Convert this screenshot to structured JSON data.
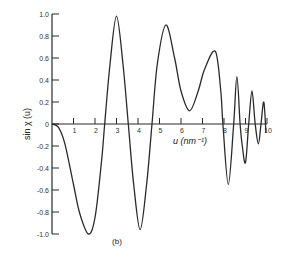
{
  "chart_data": {
    "type": "line",
    "title": "",
    "panel_label": "(b)",
    "xlabel": "u (nm⁻¹)",
    "ylabel": "sin χ (u)",
    "xlim": [
      0,
      10
    ],
    "ylim": [
      -1.0,
      1.0
    ],
    "grid": false,
    "legend": null,
    "x_ticks": [
      1,
      2,
      3,
      4,
      5,
      6,
      7,
      8,
      9,
      10
    ],
    "x_tick_labels": [
      "1",
      "2",
      "3",
      "4",
      "5",
      "6",
      "7",
      "8",
      "9",
      "10"
    ],
    "y_ticks": [
      1.0,
      0.8,
      0.6,
      0.4,
      0.2,
      0,
      -0.2,
      -0.4,
      -0.6,
      -0.8,
      -1.0
    ],
    "y_tick_labels": [
      "1.0",
      "0.8",
      "0.6",
      "0.4",
      "0.2",
      "0",
      "-0.2",
      "-0.4",
      "-0.6",
      "-0.8",
      "-1.0"
    ],
    "series": [
      {
        "name": "sin χ(u)",
        "x": [
          0,
          0.3,
          0.6,
          1.0,
          1.3,
          1.7,
          2.0,
          2.3,
          2.45,
          2.7,
          3.0,
          3.3,
          3.55,
          3.8,
          4.1,
          4.4,
          4.65,
          4.9,
          5.3,
          5.7,
          6.0,
          6.4,
          6.8,
          7.1,
          7.6,
          7.85,
          7.95,
          8.2,
          8.45,
          8.6,
          8.75,
          8.85,
          9.0,
          9.15,
          9.3,
          9.45,
          9.6,
          9.72,
          9.85,
          9.95
        ],
        "y": [
          0,
          -0.03,
          -0.18,
          -0.55,
          -0.82,
          -1.0,
          -0.85,
          -0.35,
          0,
          0.55,
          0.98,
          0.55,
          0,
          -0.55,
          -0.96,
          -0.55,
          0,
          0.55,
          0.9,
          0.6,
          0.3,
          0.12,
          0.3,
          0.5,
          0.66,
          0.3,
          0,
          -0.55,
          0,
          0.43,
          0,
          -0.2,
          -0.35,
          0,
          0.3,
          0,
          -0.18,
          0,
          0.2,
          -0.08
        ]
      }
    ]
  }
}
